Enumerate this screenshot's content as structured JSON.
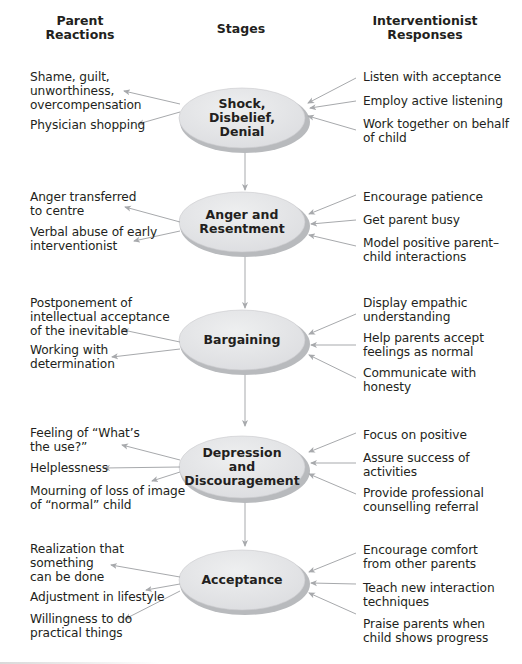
{
  "headers": {
    "left": [
      "Parent",
      "Reactions"
    ],
    "center": "Stages",
    "right": [
      "Interventionist",
      "Responses"
    ]
  },
  "colors": {
    "ellipse_fill": "#e6e7e9",
    "ellipse_shadow": "#b1b3b6",
    "arrow": "#a7a9ac",
    "text": "#231f20"
  },
  "stages": [
    {
      "name": [
        "Shock,",
        "Disbelief,",
        "Denial"
      ],
      "reactions": [
        [
          "Shame, guilt,",
          "unworthiness,",
          "overcompensation"
        ],
        [
          "Physician shopping"
        ]
      ],
      "responses": [
        [
          "Listen with acceptance"
        ],
        [
          "Employ active listening"
        ],
        [
          "Work together on behalf",
          "of child"
        ]
      ]
    },
    {
      "name": [
        "Anger and",
        "Resentment"
      ],
      "reactions": [
        [
          "Anger transferred",
          "to centre"
        ],
        [
          "Verbal abuse of early",
          "interventionist"
        ]
      ],
      "responses": [
        [
          "Encourage patience"
        ],
        [
          "Get parent busy"
        ],
        [
          "Model positive parent–",
          "child interactions"
        ]
      ]
    },
    {
      "name": [
        "Bargaining"
      ],
      "reactions": [
        [
          "Postponement of",
          "intellectual acceptance",
          "of the inevitable"
        ],
        [
          "Working with",
          "determination"
        ]
      ],
      "responses": [
        [
          "Display empathic",
          "understanding"
        ],
        [
          "Help parents accept",
          "feelings as normal"
        ],
        [
          "Communicate with",
          "honesty"
        ]
      ]
    },
    {
      "name": [
        "Depression",
        "and",
        "Discouragement"
      ],
      "reactions": [
        [
          "Feeling of “What’s",
          "the use?”"
        ],
        [
          "Helplessness"
        ],
        [
          "Mourning of loss of image",
          "of “normal” child"
        ]
      ],
      "responses": [
        [
          "Focus on positive"
        ],
        [
          "Assure success of",
          "activities"
        ],
        [
          "Provide professional",
          "counselling referral"
        ]
      ]
    },
    {
      "name": [
        "Acceptance"
      ],
      "reactions": [
        [
          "Realization that",
          "something",
          "can be done"
        ],
        [
          "Adjustment in lifestyle"
        ],
        [
          "Willingness to do",
          "practical things"
        ]
      ],
      "responses": [
        [
          "Encourage comfort",
          "from other parents"
        ],
        [
          "Teach new interaction",
          "techniques"
        ],
        [
          "Praise parents when",
          "child shows progress"
        ]
      ]
    }
  ]
}
